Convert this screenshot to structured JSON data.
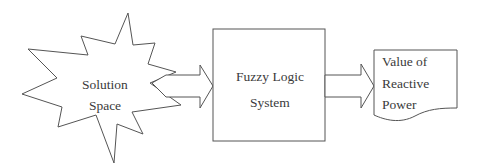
{
  "diagram": {
    "nodes": [
      {
        "id": "solution-space",
        "shape": "starburst",
        "lines": [
          "Solution",
          "Space"
        ]
      },
      {
        "id": "fuzzy-logic-system",
        "shape": "rectangle",
        "lines": [
          "Fuzzy Logic",
          "System"
        ]
      },
      {
        "id": "reactive-power",
        "shape": "document",
        "lines": [
          "Value of",
          "Reactive",
          "Power"
        ]
      }
    ],
    "edges": [
      {
        "from": "solution-space",
        "to": "fuzzy-logic-system",
        "style": "block-arrow"
      },
      {
        "from": "fuzzy-logic-system",
        "to": "reactive-power",
        "style": "block-arrow"
      }
    ]
  }
}
